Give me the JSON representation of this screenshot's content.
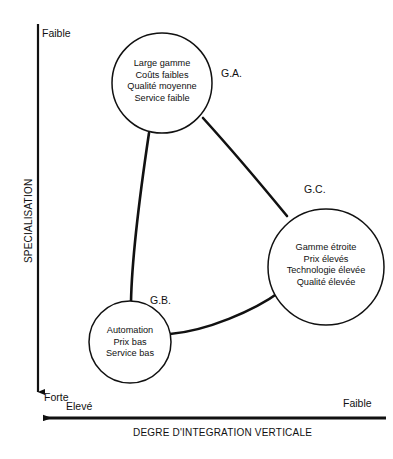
{
  "figure": {
    "axes": {
      "y": {
        "title": "SPECIALISATION",
        "top_label": "Faible",
        "bottom_label": "Forte",
        "direction": "down"
      },
      "x": {
        "title": "DEGRE D'INTEGRATION VERTICALE",
        "left_label": "Elevé",
        "right_label": "Faible",
        "direction": "left"
      }
    },
    "nodes": [
      {
        "tag": "G.A.",
        "lines": [
          "Large gamme",
          "Coûts faibles",
          "Qualité moyenne",
          "Service faible"
        ]
      },
      {
        "tag": "G.C.",
        "lines": [
          "Gamme étroite",
          "Prix élevés",
          "Technologie élevée",
          "Qualité élevée"
        ]
      },
      {
        "tag": "G.B.",
        "lines": [
          "Automation",
          "Prix bas",
          "Service bas"
        ]
      }
    ],
    "colors": {
      "stroke": "#111111",
      "background": "#ffffff"
    }
  }
}
